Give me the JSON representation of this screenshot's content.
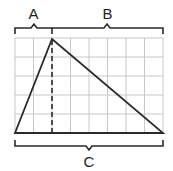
{
  "diagram": {
    "type": "geometry-triangle-on-grid",
    "grid": {
      "columns": 8,
      "rows": 5,
      "line_color": "#c8c8c8"
    },
    "triangle": {
      "vertices": [
        {
          "name": "left-base",
          "col": 0,
          "row": 5
        },
        {
          "name": "apex",
          "col": 2,
          "row": 0
        },
        {
          "name": "right-base",
          "col": 8,
          "row": 5
        }
      ],
      "stroke_color": "#2a2a2a"
    },
    "height_line": {
      "style": "dashed",
      "col": 2
    },
    "labels": {
      "a": "A",
      "b": "B",
      "c": "C"
    },
    "braces": [
      {
        "label": "A",
        "position": "top",
        "from_col": 0,
        "to_col": 2
      },
      {
        "label": "B",
        "position": "top",
        "from_col": 2,
        "to_col": 8
      },
      {
        "label": "C",
        "position": "bottom",
        "from_col": 0,
        "to_col": 8
      }
    ]
  }
}
